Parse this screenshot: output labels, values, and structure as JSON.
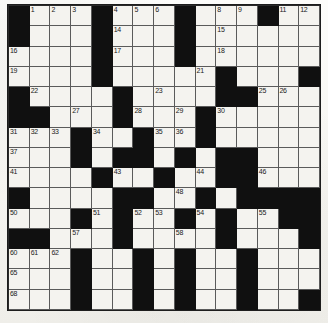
{
  "puzzle": {
    "type": "crossword-grid",
    "title": "Crossword Puzzle Grid",
    "rows": 15,
    "columns": 15,
    "cell_size_px": 20.8,
    "colors": {
      "block": "#101010",
      "open_cell": "#f4f3ef",
      "grid_line": "#5a5a5a",
      "number_text": "#1a1a1a",
      "paper": "#fbfbf9"
    },
    "legend": {
      "block_symbol": "#",
      "open_symbol": "."
    },
    "layout_rows": [
      "#...#...#...#..",
      "#...#...#......",
      "....#...#......",
      "....#.....#...#",
      "#....#....##...",
      "##...#...#.....",
      "...#..#..#.....",
      "...#.##.#.##...",
      "....#..#..##...",
      "#....##..#.####",
      "...#.#..#.#..##",
      "##...#....#...#",
      "...#..#.#..#...",
      "...#..#.#..#...",
      "...#..#.#..#..#"
    ],
    "numbered_cells": [
      {
        "n": 1,
        "row": 1,
        "col": 2
      },
      {
        "n": 2,
        "row": 1,
        "col": 3
      },
      {
        "n": 3,
        "row": 1,
        "col": 4
      },
      {
        "n": 4,
        "row": 1,
        "col": 6
      },
      {
        "n": 5,
        "row": 1,
        "col": 7
      },
      {
        "n": 6,
        "row": 1,
        "col": 8
      },
      {
        "n": 7,
        "row": 1,
        "col": 9
      },
      {
        "n": 8,
        "row": 1,
        "col": 11
      },
      {
        "n": 9,
        "row": 1,
        "col": 12
      },
      {
        "n": 10,
        "row": 1,
        "col": 13
      },
      {
        "n": 11,
        "row": 1,
        "col": 14
      },
      {
        "n": 12,
        "row": 1,
        "col": 15
      },
      {
        "n": 13,
        "row": 2,
        "col": 1
      },
      {
        "n": 14,
        "row": 2,
        "col": 6
      },
      {
        "n": 15,
        "row": 2,
        "col": 11
      },
      {
        "n": 16,
        "row": 3,
        "col": 1
      },
      {
        "n": 17,
        "row": 3,
        "col": 6
      },
      {
        "n": 18,
        "row": 3,
        "col": 11
      },
      {
        "n": 19,
        "row": 4,
        "col": 1
      },
      {
        "n": 20,
        "row": 4,
        "col": 5
      },
      {
        "n": 21,
        "row": 4,
        "col": 10
      },
      {
        "n": 22,
        "row": 5,
        "col": 2
      },
      {
        "n": 23,
        "row": 5,
        "col": 8
      },
      {
        "n": 24,
        "row": 5,
        "col": 12
      },
      {
        "n": 25,
        "row": 5,
        "col": 13
      },
      {
        "n": 26,
        "row": 5,
        "col": 14
      },
      {
        "n": 27,
        "row": 6,
        "col": 4
      },
      {
        "n": 28,
        "row": 6,
        "col": 7
      },
      {
        "n": 29,
        "row": 6,
        "col": 9
      },
      {
        "n": 30,
        "row": 6,
        "col": 11
      },
      {
        "n": 31,
        "row": 7,
        "col": 1
      },
      {
        "n": 32,
        "row": 7,
        "col": 2
      },
      {
        "n": 33,
        "row": 7,
        "col": 3
      },
      {
        "n": 34,
        "row": 7,
        "col": 5
      },
      {
        "n": 35,
        "row": 7,
        "col": 8
      },
      {
        "n": 36,
        "row": 7,
        "col": 9
      },
      {
        "n": 37,
        "row": 8,
        "col": 1
      },
      {
        "n": 38,
        "row": 8,
        "col": 4
      },
      {
        "n": 39,
        "row": 8,
        "col": 7
      },
      {
        "n": 40,
        "row": 8,
        "col": 12
      },
      {
        "n": 41,
        "row": 9,
        "col": 1
      },
      {
        "n": 42,
        "row": 9,
        "col": 5
      },
      {
        "n": 43,
        "row": 9,
        "col": 6
      },
      {
        "n": 44,
        "row": 9,
        "col": 10
      },
      {
        "n": 45,
        "row": 9,
        "col": 11
      },
      {
        "n": 46,
        "row": 9,
        "col": 13
      },
      {
        "n": 47,
        "row": 10,
        "col": 1
      },
      {
        "n": 48,
        "row": 10,
        "col": 9
      },
      {
        "n": 49,
        "row": 10,
        "col": 12
      },
      {
        "n": 50,
        "row": 11,
        "col": 1
      },
      {
        "n": 51,
        "row": 11,
        "col": 5
      },
      {
        "n": 52,
        "row": 11,
        "col": 7
      },
      {
        "n": 53,
        "row": 11,
        "col": 8
      },
      {
        "n": 54,
        "row": 11,
        "col": 10
      },
      {
        "n": 55,
        "row": 11,
        "col": 13
      },
      {
        "n": 56,
        "row": 11,
        "col": 14
      },
      {
        "n": 57,
        "row": 12,
        "col": 4
      },
      {
        "n": 58,
        "row": 12,
        "col": 9
      },
      {
        "n": 59,
        "row": 12,
        "col": 15
      },
      {
        "n": 60,
        "row": 13,
        "col": 1
      },
      {
        "n": 61,
        "row": 13,
        "col": 2
      },
      {
        "n": 62,
        "row": 13,
        "col": 3
      },
      {
        "n": 63,
        "row": 13,
        "col": 7
      },
      {
        "n": 64,
        "row": 13,
        "col": 12
      },
      {
        "n": 65,
        "row": 14,
        "col": 1
      },
      {
        "n": 66,
        "row": 14,
        "col": 7
      },
      {
        "n": 67,
        "row": 14,
        "col": 12
      },
      {
        "n": 68,
        "row": 15,
        "col": 1
      },
      {
        "n": 69,
        "row": 15,
        "col": 7
      },
      {
        "n": 70,
        "row": 15,
        "col": 12
      }
    ]
  }
}
